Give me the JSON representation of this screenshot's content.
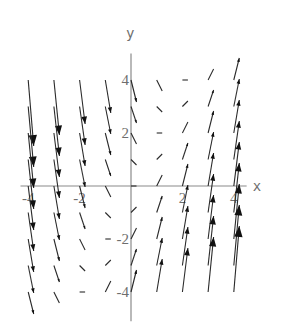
{
  "chart_data": {
    "type": "vector_field",
    "title": "",
    "xlabel": "x",
    "ylabel": "y",
    "field": {
      "description": "F(x, y) = (1, 2x - y)",
      "fx": {
        "const": 1,
        "x": 0,
        "y": 0
      },
      "fy": {
        "const": 0,
        "x": 2,
        "y": -1
      }
    },
    "grid": {
      "x": [
        -4,
        -3,
        -2,
        -1,
        0,
        1,
        2,
        3,
        4
      ],
      "y": [
        4,
        3,
        2,
        1,
        0,
        -1,
        -2,
        -3,
        -4
      ]
    },
    "xlim": [
      -4.3,
      4.5
    ],
    "ylim": [
      -5.1,
      5.0
    ],
    "x_ticks": [
      {
        "value": -4,
        "label": "-4"
      },
      {
        "value": -2,
        "label": "-2"
      },
      {
        "value": 2,
        "label": "2"
      },
      {
        "value": 4,
        "label": "4"
      }
    ],
    "y_ticks": [
      {
        "value": 4,
        "label": "4"
      },
      {
        "value": 2,
        "label": "2"
      },
      {
        "value": -2,
        "label": "-2"
      },
      {
        "value": -4,
        "label": "-4"
      }
    ],
    "grid_lines": false,
    "legend": null
  },
  "layout": {
    "origin_px": [
      131,
      186
    ],
    "unit_px_x": 25.7,
    "unit_px_y": 26.5,
    "arrow_scale_px": 5.5,
    "axis_color": "#8a8a8a",
    "arrow_color": "#2a2a2a"
  }
}
